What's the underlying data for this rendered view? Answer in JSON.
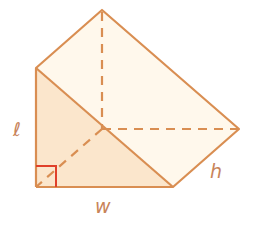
{
  "diagram": {
    "type": "triangular prism",
    "labels": {
      "length": "ℓ",
      "width": "w",
      "height": "h"
    },
    "colors": {
      "edge": "#d98e52",
      "right_angle": "#e0402a",
      "front_face_fill": "#fbe6cc",
      "side_face_fill": "#fff8ec",
      "label": "#c8845a"
    }
  }
}
